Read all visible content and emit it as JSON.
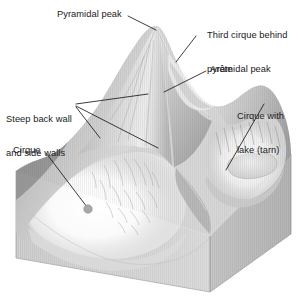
{
  "figure": {
    "kind": "geomorphology-block-diagram",
    "background_color": "#ffffff",
    "line_color": "#1a1a1a",
    "terrain_light": "#fdfdfd",
    "terrain_mid": "#c9c9c9",
    "terrain_shadow": "#8e8e8e",
    "block_face": "#d2d2d2",
    "block_face_right": "#bdbdbd"
  },
  "labels": {
    "pyramidal_peak": "Pyramidal peak",
    "third_cirque_line1": "Third cirque behind",
    "third_cirque_line2": "pyramidal peak",
    "arete": "Arête",
    "cirque_with_lake_line1": "Cirque with",
    "cirque_with_lake_line2": "lake (tarn)",
    "steep_walls_line1": "Steep back wall",
    "steep_walls_line2": "and side walls",
    "cirque": "Cirque"
  },
  "features": [
    {
      "name": "pyramidal-peak",
      "description": "Sharp three-sided summit at centre of the block"
    },
    {
      "name": "arete",
      "description": "Knife-edge ridge descending right from the peak"
    },
    {
      "name": "cirque-front",
      "description": "Large armchair hollow in the left foreground"
    },
    {
      "name": "cirque-with-tarn",
      "description": "Right-hand cirque containing a small lake"
    },
    {
      "name": "third-cirque",
      "description": "Cirque hidden behind the pyramidal peak"
    },
    {
      "name": "cirque-marker-dot",
      "description": "Round dot marking the cirque floor"
    }
  ]
}
